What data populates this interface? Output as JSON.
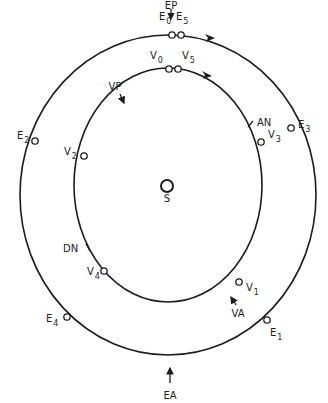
{
  "diagram": {
    "title": "",
    "center_label": "S",
    "colors": {
      "stroke": "#1c1c1c",
      "background": "#ffffff"
    },
    "orbits": {
      "outer": {
        "name": "Earth orbit",
        "cx": 168,
        "cy": 195,
        "rx": 148,
        "ry": 160
      },
      "inner": {
        "name": "Venus orbit",
        "cx": 168,
        "cy": 185,
        "rx": 94,
        "ry": 117
      }
    },
    "sun": {
      "label": "S",
      "x": 167,
      "y": 186,
      "r": 6
    },
    "earth_points": [
      {
        "label": "E",
        "sub": "0",
        "x": 172,
        "y": 35,
        "lx": 159,
        "ly": 20
      },
      {
        "label": "E",
        "sub": "5",
        "x": 181,
        "y": 35,
        "lx": 176,
        "ly": 20
      },
      {
        "label": "E",
        "sub": "3",
        "x": 291,
        "y": 128,
        "lx": 298,
        "ly": 128
      },
      {
        "label": "E",
        "sub": "2",
        "x": 35,
        "y": 141,
        "lx": 17,
        "ly": 139
      },
      {
        "label": "E",
        "sub": "4",
        "x": 67,
        "y": 317,
        "lx": 46,
        "ly": 322
      },
      {
        "label": "E",
        "sub": "1",
        "x": 267,
        "y": 320,
        "lx": 270,
        "ly": 336
      }
    ],
    "venus_points": [
      {
        "label": "V",
        "sub": "0",
        "x": 169,
        "y": 69,
        "lx": 150,
        "ly": 59
      },
      {
        "label": "V",
        "sub": "5",
        "x": 178,
        "y": 69,
        "lx": 182,
        "ly": 59
      },
      {
        "label": "V",
        "sub": "3",
        "x": 261,
        "y": 142,
        "lx": 268,
        "ly": 138
      },
      {
        "label": "V",
        "sub": "2",
        "x": 84,
        "y": 156,
        "lx": 64,
        "ly": 155
      },
      {
        "label": "V",
        "sub": "4",
        "x": 104,
        "y": 271,
        "lx": 87,
        "ly": 275
      },
      {
        "label": "V",
        "sub": "1",
        "x": 239,
        "y": 282,
        "lx": 246,
        "ly": 291
      }
    ],
    "annotations": {
      "EP": {
        "label": "EP",
        "x": 171,
        "y": 5
      },
      "EA": {
        "label": "EA",
        "x": 170,
        "y": 395
      },
      "VP": {
        "label": "VP",
        "x": 115,
        "y": 90
      },
      "VA": {
        "label": "VA",
        "x": 238,
        "y": 317
      },
      "AN": {
        "label": "AN",
        "x": 257,
        "y": 126
      },
      "DN": {
        "label": "DN",
        "x": 63,
        "y": 252
      }
    },
    "direction_arrows": [
      {
        "name": "outer-orbit-direction",
        "x": 211,
        "y": 37
      },
      {
        "name": "inner-orbit-direction",
        "x": 208,
        "y": 74
      }
    ]
  }
}
